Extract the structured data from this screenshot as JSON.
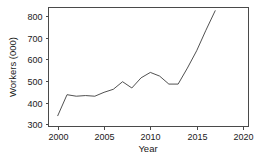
{
  "chart_data": {
    "type": "line",
    "title": "",
    "xlabel": "Year",
    "ylabel": "Workers (000)",
    "xlim": [
      1999.0,
      2020.6
    ],
    "ylim": [
      290,
      840
    ],
    "xticks": [
      2000,
      2005,
      2010,
      2015,
      2020
    ],
    "xtick_labels": [
      "2000",
      "2005",
      "2010",
      "2015",
      "2020"
    ],
    "yticks": [
      300,
      400,
      500,
      600,
      700,
      800
    ],
    "ytick_labels": [
      "300",
      "400",
      "500",
      "600",
      "700",
      "800"
    ],
    "grid": false,
    "legend": null,
    "series": [
      {
        "name": "Workers",
        "color": "#3d3d3d",
        "x": [
          2000,
          2001,
          2002,
          2003,
          2004,
          2005,
          2006,
          2007,
          2008,
          2009,
          2010,
          2011,
          2012,
          2013,
          2014,
          2015,
          2016,
          2017
        ],
        "values": [
          340,
          437,
          430,
          433,
          430,
          448,
          462,
          497,
          468,
          515,
          540,
          523,
          486,
          486,
          560,
          640,
          735,
          825
        ]
      }
    ]
  },
  "axes": {
    "y_title": "Workers (000)",
    "x_title": "Year"
  }
}
